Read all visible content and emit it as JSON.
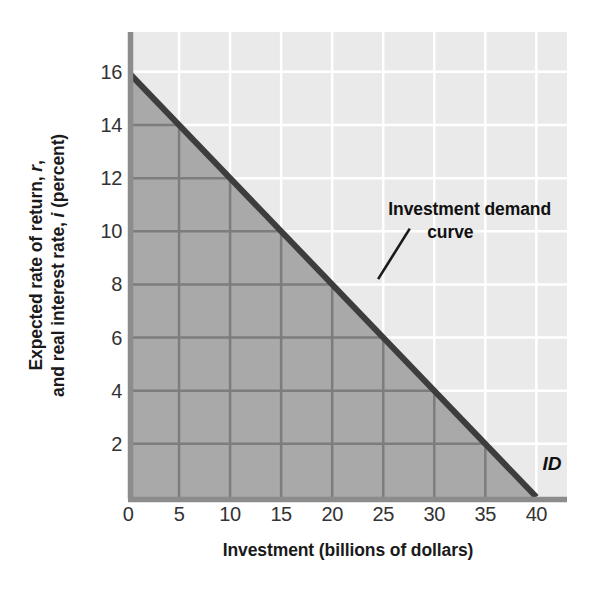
{
  "chart_data": {
    "type": "line",
    "title": "",
    "xlabel": "Investment (billions of dollars)",
    "ylabel_line1": "Expected rate of return, r,",
    "ylabel_line2": "and real interest rate, i (percent)",
    "ylabel_italic_1": "r",
    "ylabel_italic_2": "i",
    "xlim": [
      0,
      43
    ],
    "ylim": [
      0,
      17.5
    ],
    "xticks": [
      "0",
      "5",
      "10",
      "15",
      "20",
      "25",
      "30",
      "35",
      "40"
    ],
    "xtick_values": [
      0,
      5,
      10,
      15,
      20,
      25,
      30,
      35,
      40
    ],
    "yticks": [
      "2",
      "4",
      "6",
      "8",
      "10",
      "12",
      "14",
      "16"
    ],
    "ytick_values": [
      2,
      4,
      6,
      8,
      10,
      12,
      14,
      16
    ],
    "grid": true,
    "grid_x_step": 5,
    "grid_y_step": 2,
    "legend": "none",
    "series": [
      {
        "name": "Investment demand curve",
        "short_name": "ID",
        "x": [
          0,
          5,
          10,
          15,
          20,
          25,
          30,
          35,
          40
        ],
        "values": [
          16,
          14,
          12,
          10,
          8,
          6,
          4,
          2,
          0
        ],
        "line_color": "#3d3d3d",
        "line_width": 6,
        "fill_below": true,
        "fill_color": "#a9a9a9"
      }
    ],
    "annotations": [
      {
        "name": "investment-demand-curve-callout",
        "text_line1": "Investment demand",
        "text_line2": "curve",
        "x": 25.5,
        "y": 10.6,
        "leader_from": [
          24.5,
          8.2
        ],
        "leader_to": [
          27.6,
          10.1
        ]
      },
      {
        "name": "id-curve-label",
        "text": "ID",
        "x": 40.6,
        "y": 1.0
      }
    ],
    "colors": {
      "plot_background_upper": "#eaeaea",
      "plot_background_shaded": "#a9a9a9",
      "gridline_upper": "#ffffff",
      "gridline_shaded": "#7d7d7d",
      "axis_spine": "#8c8c8c",
      "curve": "#3d3d3d",
      "text": "#1a1a1a",
      "tick_text": "#333333",
      "page_background": "#ffffff"
    }
  }
}
